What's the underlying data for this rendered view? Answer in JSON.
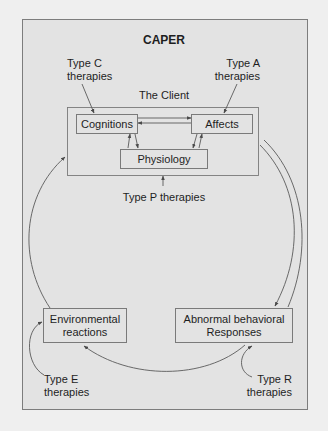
{
  "diagram": {
    "title": "CAPER",
    "client_label": "The Client",
    "nodes": {
      "cognitions": "Cognitions",
      "affects": "Affects",
      "physiology": "Physiology",
      "environmental_line1": "Environmental",
      "environmental_line2": "reactions",
      "responses_line1": "Abnormal behavioral",
      "responses_line2": "Responses"
    },
    "therapies": {
      "type_c_line1": "Type C",
      "type_c_line2": "therapies",
      "type_a_line1": "Type A",
      "type_a_line2": "therapies",
      "type_p": "Type P therapies",
      "type_e_line1": "Type E",
      "type_e_line2": "therapies",
      "type_r_line1": "Type R",
      "type_r_line2": "therapies"
    },
    "colors": {
      "page_background": "#efefef",
      "panel_background": "#e3e3e3",
      "line": "#5a5a5a",
      "text": "#1e1e1e"
    }
  }
}
